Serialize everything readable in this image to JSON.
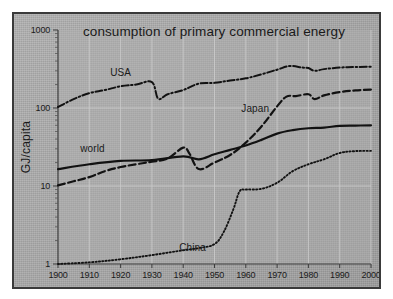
{
  "chart_data": {
    "type": "line",
    "title": "consumption of primary commercial energy",
    "xlabel": "",
    "ylabel": "GJ/capita",
    "yscale": "log",
    "ylim": [
      1,
      1000
    ],
    "xlim": [
      1900,
      2000
    ],
    "grid": true,
    "legend_position": "inline-labels",
    "ytick_labels": [
      "1000",
      "100",
      "10",
      "1"
    ],
    "ytick_values": [
      1000,
      100,
      10,
      1
    ],
    "xtick_labels": [
      "1900",
      "1910",
      "1920",
      "1930",
      "1940",
      "1950",
      "1960",
      "1970",
      "1980",
      "1990",
      "2000"
    ],
    "xtick_values": [
      1900,
      1910,
      1920,
      1930,
      1940,
      1950,
      1960,
      1970,
      1980,
      1990,
      2000
    ],
    "series": [
      {
        "name": "USA",
        "label": "USA",
        "style": "dash-dot",
        "color": "#121212",
        "x": [
          1900,
          1905,
          1910,
          1915,
          1920,
          1925,
          1930,
          1932,
          1935,
          1940,
          1945,
          1950,
          1955,
          1960,
          1965,
          1970,
          1974,
          1978,
          1980,
          1982,
          1985,
          1990,
          1995,
          2000
        ],
        "y": [
          103,
          130,
          155,
          170,
          190,
          200,
          215,
          132,
          150,
          170,
          205,
          210,
          225,
          240,
          270,
          310,
          345,
          330,
          325,
          300,
          315,
          330,
          335,
          338
        ]
      },
      {
        "name": "Japan",
        "label": "Japan",
        "style": "dashed",
        "color": "#121212",
        "x": [
          1900,
          1905,
          1910,
          1915,
          1920,
          1925,
          1930,
          1935,
          1940,
          1942,
          1945,
          1950,
          1955,
          1960,
          1965,
          1970,
          1973,
          1976,
          1980,
          1982,
          1985,
          1990,
          1995,
          2000
        ],
        "y": [
          10.2,
          11.5,
          13.0,
          15.5,
          17.5,
          19.0,
          20.5,
          22.5,
          31.0,
          26.0,
          16.5,
          20.0,
          25.0,
          36.0,
          58.0,
          105.0,
          140.0,
          142.0,
          150.0,
          130.0,
          145.0,
          160.0,
          168.0,
          172.0
        ]
      },
      {
        "name": "world",
        "label": "world",
        "style": "solid",
        "color": "#121212",
        "x": [
          1900,
          1910,
          1920,
          1930,
          1940,
          1945,
          1950,
          1955,
          1960,
          1965,
          1970,
          1975,
          1980,
          1985,
          1990,
          1995,
          2000
        ],
        "y": [
          16.5,
          19.0,
          21.0,
          21.5,
          24.0,
          22.0,
          25.5,
          29.0,
          33.0,
          39.0,
          47.0,
          52.0,
          55.0,
          56.0,
          59.0,
          59.5,
          60.0
        ]
      },
      {
        "name": "China",
        "label": "China",
        "style": "dotted",
        "color": "#121212",
        "x": [
          1900,
          1910,
          1920,
          1930,
          1940,
          1945,
          1950,
          1953,
          1956,
          1958,
          1960,
          1965,
          1970,
          1975,
          1980,
          1985,
          1990,
          1995,
          2000
        ],
        "y": [
          1.0,
          1.05,
          1.15,
          1.3,
          1.5,
          1.6,
          1.8,
          2.6,
          5.0,
          8.5,
          9.0,
          9.2,
          11.0,
          15.5,
          19.0,
          22.0,
          26.5,
          28.0,
          28.2
        ]
      }
    ],
    "annotations": [
      {
        "text": "USA",
        "x": 1920,
        "y": 260
      },
      {
        "text": "Japan",
        "x": 1963,
        "y": 88
      },
      {
        "text": "world",
        "x": 1911,
        "y": 27
      },
      {
        "text": "China",
        "x": 1943,
        "y": 1.45
      }
    ]
  },
  "colors": {
    "background": "#ababab",
    "frame": "#3a3a3a",
    "gridline": "#cbcbcb",
    "axis": "#3d3d3d",
    "ink": "#121212"
  }
}
